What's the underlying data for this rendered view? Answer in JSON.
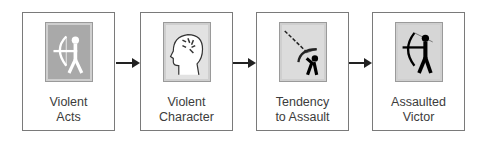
{
  "diagram": {
    "type": "flow",
    "nodes": [
      {
        "id": "violent-acts",
        "line1": "Violent",
        "line2": "Acts",
        "icon": "archer-white-icon",
        "icon_bg": "#a9a9a9"
      },
      {
        "id": "violent-character",
        "line1": "Violent",
        "line2": "Character",
        "icon": "head-profile-icon",
        "icon_bg": "#e2e2e2"
      },
      {
        "id": "tendency-to-assault",
        "line1": "Tendency",
        "line2": "to Assault",
        "icon": "archer-aiming-icon",
        "icon_bg": "#dcdcdc"
      },
      {
        "id": "assaulted-victor",
        "line1": "Assaulted",
        "line2": "Victor",
        "icon": "archer-black-icon",
        "icon_bg": "#d6d6d6"
      }
    ],
    "edges": [
      {
        "from": "violent-acts",
        "to": "violent-character"
      },
      {
        "from": "violent-character",
        "to": "tendency-to-assault"
      },
      {
        "from": "tendency-to-assault",
        "to": "assaulted-victor"
      }
    ],
    "colors": {
      "border": "#7a7a7a",
      "text": "#3c3c3c",
      "arrow": "#222222"
    }
  }
}
